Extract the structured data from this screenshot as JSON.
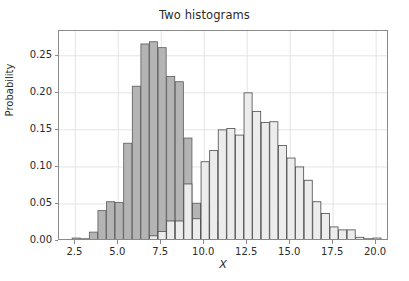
{
  "chart_data": {
    "type": "bar",
    "title": "Two histograms",
    "xlabel": "X",
    "ylabel": "Probability",
    "grid": true,
    "legend": null,
    "xlim": [
      1.55,
      20.75
    ],
    "ylim": [
      0.0,
      0.2835
    ],
    "xticks": [
      2.5,
      5.0,
      7.5,
      10.0,
      12.5,
      15.0,
      17.5,
      20.0
    ],
    "xtick_labels": [
      "2.5",
      "5.0",
      "7.5",
      "10.0",
      "12.5",
      "15.0",
      "17.5",
      "20.0"
    ],
    "yticks": [
      0.0,
      0.05,
      0.1,
      0.15,
      0.2,
      0.25
    ],
    "ytick_labels": [
      "0.00",
      "0.05",
      "0.10",
      "0.15",
      "0.20",
      "0.25"
    ],
    "bar_width": 0.47,
    "series": [
      {
        "name": "histogram-1",
        "fill_color": "#b4b4b4",
        "edge_color": "#5a5a5a",
        "bin_centers": [
          2.55,
          3.05,
          3.55,
          4.05,
          4.55,
          5.05,
          5.55,
          6.05,
          6.55,
          7.05,
          7.55,
          8.05,
          8.55,
          9.05,
          9.55,
          10.05,
          10.55,
          11.05,
          11.55
        ],
        "values": [
          0.004,
          0.003,
          0.012,
          0.041,
          0.053,
          0.052,
          0.132,
          0.209,
          0.266,
          0.269,
          0.261,
          0.222,
          0.215,
          0.139,
          0.051,
          0.051,
          0.026,
          0.009,
          0.002
        ]
      },
      {
        "name": "histogram-2",
        "fill_color": "#ececec",
        "edge_color": "#4a4a4a",
        "bin_centers": [
          6.55,
          7.05,
          7.55,
          8.05,
          8.55,
          9.05,
          9.55,
          10.05,
          10.55,
          11.05,
          11.55,
          12.05,
          12.55,
          13.05,
          13.55,
          14.05,
          14.55,
          15.05,
          15.55,
          16.05,
          16.55,
          17.05,
          17.55,
          18.05,
          18.55,
          19.05,
          19.55,
          20.05
        ],
        "values": [
          0.002,
          0.007,
          0.013,
          0.027,
          0.027,
          0.077,
          0.03,
          0.107,
          0.122,
          0.15,
          0.152,
          0.143,
          0.2,
          0.175,
          0.16,
          0.161,
          0.129,
          0.112,
          0.1,
          0.082,
          0.053,
          0.037,
          0.019,
          0.015,
          0.015,
          0.005,
          0.003,
          0.004
        ]
      }
    ]
  },
  "axes": {
    "spine_color": "#8a8a8a",
    "grid_color": "#e4e4e4",
    "background": "#ffffff"
  }
}
